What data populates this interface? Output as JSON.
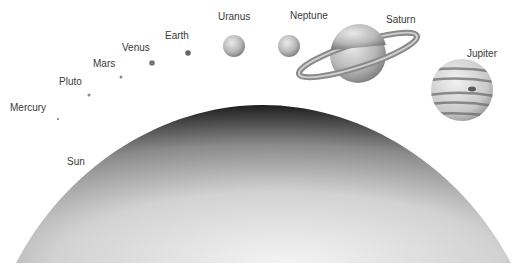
{
  "diagram": {
    "sun": {
      "label": "Sun"
    },
    "planets": [
      {
        "name": "Mercury",
        "label": "Mercury"
      },
      {
        "name": "Pluto",
        "label": "Pluto"
      },
      {
        "name": "Mars",
        "label": "Mars"
      },
      {
        "name": "Venus",
        "label": "Venus"
      },
      {
        "name": "Earth",
        "label": "Earth"
      },
      {
        "name": "Uranus",
        "label": "Uranus"
      },
      {
        "name": "Neptune",
        "label": "Neptune"
      },
      {
        "name": "Saturn",
        "label": "Saturn"
      },
      {
        "name": "Jupiter",
        "label": "Jupiter"
      }
    ]
  }
}
